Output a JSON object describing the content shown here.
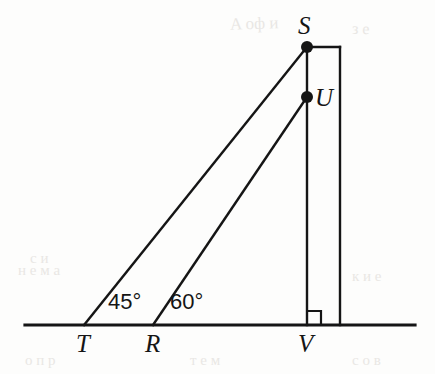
{
  "figure": {
    "type": "geometry-diagram",
    "background_color": "#fdfdfc",
    "stroke_color": "#151515"
  },
  "points": [
    {
      "id": "S",
      "label": "S",
      "x": 307,
      "y": 47,
      "dot": true,
      "label_x": 298,
      "label_y": 13
    },
    {
      "id": "U",
      "label": "U",
      "x": 307,
      "y": 97,
      "dot": true,
      "label_x": 315,
      "label_y": 85
    },
    {
      "id": "T",
      "label": "T",
      "x": 84,
      "y": 325,
      "dot": false,
      "label_x": 76,
      "label_y": 331
    },
    {
      "id": "R",
      "label": "R",
      "x": 153,
      "y": 325,
      "dot": false,
      "label_x": 145,
      "label_y": 331
    },
    {
      "id": "V",
      "label": "V",
      "x": 307,
      "y": 325,
      "dot": false,
      "label_x": 298,
      "label_y": 331
    }
  ],
  "segments": [
    {
      "name": "ground-line",
      "from": [
        25,
        325
      ],
      "to": [
        415,
        325
      ],
      "width": 3.2
    },
    {
      "name": "pole-line",
      "from": [
        307,
        47
      ],
      "to": [
        307,
        325
      ],
      "width": 2.4
    },
    {
      "name": "rect-top-edge",
      "from": [
        307,
        47
      ],
      "to": [
        340,
        47
      ],
      "width": 2.4
    },
    {
      "name": "rect-right-edge",
      "from": [
        340,
        47
      ],
      "to": [
        340,
        325
      ],
      "width": 2.4
    },
    {
      "name": "sight-line-T-to-S",
      "from": [
        84,
        325
      ],
      "to": [
        307,
        47
      ],
      "width": 2.4
    },
    {
      "name": "sight-line-R-to-U",
      "from": [
        153,
        325
      ],
      "to": [
        307,
        97
      ],
      "width": 2.4
    }
  ],
  "right_angle": {
    "name": "right-angle-at-V",
    "x": 307,
    "y": 325,
    "size": 14
  },
  "angles": [
    {
      "name": "angle-at-T",
      "label": "45°",
      "vertex": "T",
      "label_x": 108,
      "label_y": 291
    },
    {
      "name": "angle-at-R",
      "label": "60°",
      "vertex": "R",
      "label_x": 170,
      "label_y": 291
    }
  ],
  "ghost_marks": [
    {
      "text": "Α оф и",
      "x": 230,
      "y": 14,
      "size": 17,
      "rot": -2
    },
    {
      "text": "з е",
      "x": 352,
      "y": 20,
      "size": 16,
      "rot": 1
    },
    {
      "text": "с и",
      "x": 30,
      "y": 250,
      "size": 15,
      "rot": 0
    },
    {
      "text": "н е м а",
      "x": 18,
      "y": 262,
      "size": 15,
      "rot": 0
    },
    {
      "text": "к и е",
      "x": 352,
      "y": 268,
      "size": 15,
      "rot": 0
    },
    {
      "text": "о п р",
      "x": 25,
      "y": 352,
      "size": 15,
      "rot": 0
    },
    {
      "text": "т е м",
      "x": 190,
      "y": 352,
      "size": 15,
      "rot": 0
    },
    {
      "text": "с о в",
      "x": 352,
      "y": 352,
      "size": 15,
      "rot": 0
    }
  ]
}
